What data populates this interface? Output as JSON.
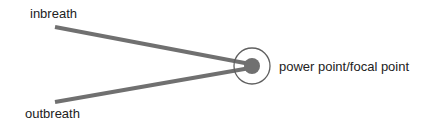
{
  "diagram": {
    "labels": {
      "inbreath": "inbreath",
      "outbreath": "outbreath",
      "focal": "power point/focal point"
    },
    "colors": {
      "line": "#707070",
      "dot": "#707070",
      "ring": "#606060",
      "text": "#222222",
      "background": "#ffffff"
    },
    "geometry": {
      "focal_center": [
        252,
        66
      ],
      "inbreath_start": [
        55,
        27
      ],
      "outbreath_start": [
        55,
        102
      ],
      "dot_radius": 8,
      "ring_radius": 18,
      "line_width": 4
    }
  }
}
